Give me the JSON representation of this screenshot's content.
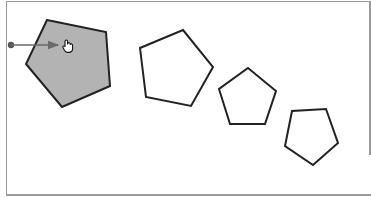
{
  "diagram": {
    "colors": {
      "selected_fill": "#b3b3b3",
      "stroke": "#222222",
      "arrow": "#6a6a6a",
      "frame": "#9a9a9a"
    },
    "shapes": [
      {
        "id": "pentagon-1",
        "state": "selected",
        "points": "47,20 106,32 110,86 62,107 26,64"
      },
      {
        "id": "pentagon-2",
        "state": "normal",
        "points": "183,30 213,67 191,106 146,97 140,48"
      },
      {
        "id": "pentagon-3",
        "state": "normal",
        "points": "248,68 276,91 265,124 230,124 219,89"
      },
      {
        "id": "pentagon-4",
        "state": "normal",
        "points": "326,109 338,143 313,165 285,146 292,111"
      }
    ],
    "drag_arrow": {
      "x1": 11,
      "y1": 45,
      "x2": 59,
      "y2": 45
    },
    "cursor": {
      "icon": "hand-cursor-icon",
      "x": 67,
      "y": 46
    }
  }
}
